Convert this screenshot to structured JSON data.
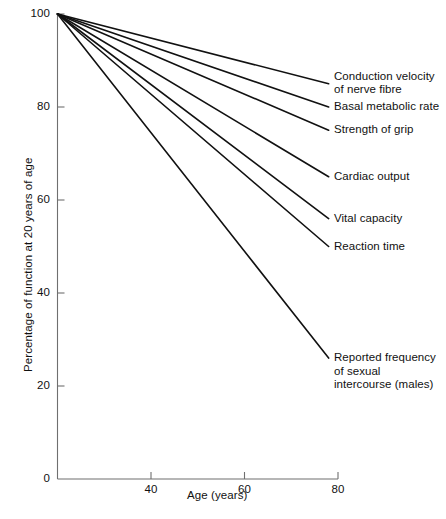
{
  "chart_data": {
    "type": "line",
    "title": "",
    "subtitle": "",
    "xlabel": "Age (years)",
    "ylabel": "Percentage of function at 20 years of age",
    "xlim": [
      20,
      80
    ],
    "ylim": [
      0,
      100
    ],
    "xticks": [
      40,
      60,
      80
    ],
    "xtick_labels": [
      "40",
      "60",
      "80"
    ],
    "yticks": [
      0,
      20,
      40,
      60,
      80,
      100
    ],
    "ytick_labels": [
      "0",
      "20",
      "40",
      "60",
      "80",
      "100"
    ],
    "grid": false,
    "legend_position": "right-inline-labels",
    "x": [
      20,
      78
    ],
    "series": [
      {
        "name": "Conduction velocity of nerve fibre",
        "label": "Conduction velocity\nof nerve fibre",
        "values": [
          100,
          85
        ]
      },
      {
        "name": "Basal metabolic rate",
        "label": "Basal metabolic rate",
        "values": [
          100,
          80
        ]
      },
      {
        "name": "Strength of grip",
        "label": "Strength of grip",
        "values": [
          100,
          75
        ]
      },
      {
        "name": "Cardiac output",
        "label": "Cardiac output",
        "values": [
          100,
          65
        ]
      },
      {
        "name": "Vital capacity",
        "label": "Vital capacity",
        "values": [
          100,
          56
        ]
      },
      {
        "name": "Reaction time",
        "label": "Reaction time",
        "values": [
          100,
          50
        ]
      },
      {
        "name": "Reported frequency of sexual intercourse (males)",
        "label": "Reported frequency\nof sexual\nintercourse (males)",
        "values": [
          100,
          26
        ]
      }
    ],
    "colors": {
      "line": "#111111",
      "axis": "#6f6f6f",
      "background": "#ffffff",
      "text": "#111111"
    }
  }
}
